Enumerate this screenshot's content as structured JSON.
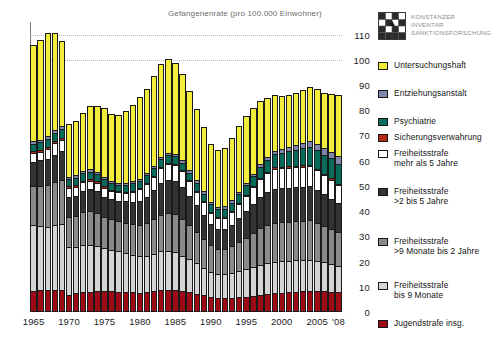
{
  "figure": {
    "title": "Gefangenenrate (pro 100.000 Einwohner)",
    "brand": {
      "logo_icon": "konstanz-grid-logo-icon",
      "line1": "KONSTANZER",
      "line2": "INVENTAR",
      "line3": "SANKTIONSFORSCHUNG"
    }
  },
  "legend": {
    "items": [
      {
        "label": "Untersuchungshaft",
        "color": "#f2ed3a",
        "top": 52
      },
      {
        "label": "Entziehungsanstalt",
        "color": "#8086ad",
        "top": 80
      },
      {
        "label": "Psychiatrie",
        "color": "#066b5a",
        "top": 108
      },
      {
        "label": "Sicherungsverwahrung",
        "color": "#b32b10",
        "top": 124
      },
      {
        "label": "Freiheitsstrafe\nmehr als 5 Jahre",
        "color": "#ffffff",
        "top": 140
      },
      {
        "label": "Freiheitsstrafe\n>2 bis 5 Jahre",
        "color": "#333333",
        "top": 178
      },
      {
        "label": "Freiheitsstrafe\n>9 Monate bis 2 Jahre",
        "color": "#8a8a8a",
        "top": 228
      },
      {
        "label": "Freiheitsstrafe\nbis 9 Monate",
        "color": "#d4d4d4",
        "top": 272
      },
      {
        "label": "Jugendstrafe insg.",
        "color": "#9e0b16",
        "top": 310
      }
    ]
  },
  "chart_data": {
    "type": "bar",
    "stacked": true,
    "title": "Gefangenenrate (pro 100.000 Einwohner)",
    "xlabel": "",
    "ylabel": "",
    "ylim": [
      0,
      115
    ],
    "yticks": [
      0,
      10,
      20,
      30,
      40,
      50,
      60,
      70,
      80,
      90,
      100,
      110
    ],
    "grid": "horizontal-dotted-at-100",
    "legend_position": "right",
    "xtick_labels": [
      "1965",
      "1970",
      "1975",
      "1980",
      "1985",
      "1990",
      "1995",
      "2000",
      "2005",
      "'08"
    ],
    "xtick_years": [
      1965,
      1970,
      1975,
      1980,
      1985,
      1990,
      1995,
      2000,
      2005,
      2008
    ],
    "categories": [
      1965,
      1966,
      1967,
      1968,
      1969,
      1970,
      1971,
      1972,
      1973,
      1974,
      1975,
      1976,
      1977,
      1978,
      1979,
      1980,
      1981,
      1982,
      1983,
      1984,
      1985,
      1986,
      1987,
      1988,
      1989,
      1990,
      1991,
      1992,
      1993,
      1994,
      1995,
      1996,
      1997,
      1998,
      1999,
      2000,
      2001,
      2002,
      2003,
      2004,
      2005,
      2006,
      2007,
      2008
    ],
    "series": [
      {
        "name": "Jugendstrafe insg.",
        "color": "#9e0b16",
        "values": [
          8.5,
          8.6,
          8.8,
          8.9,
          8.8,
          6.6,
          7.6,
          8.0,
          8.1,
          8.3,
          8.3,
          8.2,
          8.0,
          7.9,
          7.8,
          7.6,
          7.8,
          8.2,
          8.6,
          8.8,
          8.8,
          8.4,
          7.9,
          7.3,
          6.6,
          5.9,
          5.4,
          5.4,
          5.6,
          5.8,
          6.0,
          6.4,
          6.8,
          7.1,
          7.4,
          7.6,
          7.8,
          8.0,
          8.2,
          8.3,
          8.3,
          8.2,
          8.0,
          7.8
        ]
      },
      {
        "name": "Freiheitsstrafe bis 9 Monate",
        "color": "#d4d4d4",
        "values": [
          26.0,
          25.5,
          25.0,
          25.5,
          26.0,
          19.0,
          18.0,
          18.5,
          18.5,
          18.0,
          17.0,
          16.5,
          16.0,
          15.5,
          15.0,
          14.5,
          14.5,
          15.0,
          15.5,
          15.5,
          15.0,
          14.0,
          13.0,
          12.0,
          11.0,
          10.0,
          9.5,
          9.5,
          10.0,
          10.5,
          11.0,
          11.5,
          12.0,
          12.5,
          12.5,
          12.5,
          12.5,
          12.5,
          12.5,
          12.5,
          12.0,
          11.5,
          11.0,
          10.5
        ]
      },
      {
        "name": "Freiheitsstrafe >9 Monate bis 2 Jahre",
        "color": "#8a8a8a",
        "values": [
          15.5,
          16.0,
          16.5,
          17.0,
          17.5,
          12.0,
          12.5,
          13.0,
          13.5,
          13.0,
          12.5,
          12.0,
          12.0,
          12.0,
          12.0,
          12.5,
          13.0,
          13.5,
          14.5,
          15.0,
          15.0,
          14.5,
          13.5,
          12.5,
          11.5,
          10.5,
          10.0,
          10.0,
          10.5,
          11.5,
          12.5,
          13.5,
          14.5,
          15.0,
          15.5,
          15.5,
          15.5,
          15.5,
          15.5,
          15.5,
          15.0,
          14.5,
          14.0,
          13.5
        ]
      },
      {
        "name": "Freiheitsstrafe >2 bis 5 Jahre",
        "color": "#333333",
        "values": [
          9.5,
          10.0,
          10.5,
          11.0,
          11.5,
          8.0,
          8.0,
          8.5,
          8.5,
          8.5,
          8.0,
          8.0,
          8.0,
          8.5,
          9.0,
          9.5,
          10.5,
          11.5,
          12.5,
          13.0,
          13.0,
          12.5,
          11.5,
          10.5,
          9.5,
          8.5,
          8.0,
          8.0,
          8.5,
          9.5,
          10.5,
          11.5,
          12.5,
          13.0,
          13.5,
          13.5,
          13.5,
          13.5,
          13.5,
          13.5,
          13.0,
          12.5,
          12.0,
          11.5
        ]
      },
      {
        "name": "Freiheitsstrafe mehr als 5 Jahre",
        "color": "#ffffff",
        "values": [
          3.5,
          3.5,
          4.0,
          4.5,
          4.5,
          3.5,
          3.5,
          3.5,
          3.5,
          3.5,
          3.5,
          3.5,
          3.5,
          3.5,
          4.0,
          4.5,
          5.0,
          5.5,
          6.0,
          6.5,
          6.5,
          6.5,
          6.0,
          5.5,
          5.0,
          4.5,
          4.5,
          4.5,
          5.0,
          5.5,
          6.0,
          6.5,
          7.0,
          7.5,
          8.0,
          8.0,
          8.0,
          8.0,
          8.0,
          8.0,
          8.0,
          7.5,
          7.5,
          7.0
        ]
      },
      {
        "name": "Sicherungsverwahrung",
        "color": "#b32b10",
        "values": [
          0.8,
          0.8,
          0.8,
          0.8,
          0.8,
          0.7,
          0.7,
          0.6,
          0.6,
          0.5,
          0.5,
          0.4,
          0.4,
          0.4,
          0.4,
          0.4,
          0.4,
          0.4,
          0.4,
          0.4,
          0.4,
          0.4,
          0.4,
          0.4,
          0.4,
          0.4,
          0.4,
          0.4,
          0.4,
          0.4,
          0.4,
          0.4,
          0.4,
          0.4,
          0.5,
          0.5,
          0.5,
          0.5,
          0.6,
          0.6,
          0.6,
          0.6,
          0.6,
          0.6
        ]
      },
      {
        "name": "Psychiatrie",
        "color": "#066b5a",
        "values": [
          3.0,
          3.0,
          3.2,
          3.4,
          3.5,
          3.0,
          3.0,
          3.0,
          3.0,
          3.0,
          2.8,
          2.6,
          2.6,
          2.6,
          2.8,
          3.0,
          3.0,
          3.0,
          3.0,
          3.0,
          3.0,
          3.0,
          3.0,
          3.0,
          3.0,
          3.0,
          3.0,
          3.2,
          3.4,
          3.6,
          3.8,
          4.0,
          4.4,
          4.8,
          5.2,
          5.6,
          6.0,
          6.4,
          6.8,
          7.2,
          7.4,
          7.6,
          7.8,
          8.0
        ]
      },
      {
        "name": "Entziehungsanstalt",
        "color": "#8086ad",
        "values": [
          1.0,
          1.0,
          1.0,
          1.0,
          1.0,
          0.9,
          0.9,
          0.9,
          0.9,
          0.9,
          0.8,
          0.8,
          0.8,
          0.8,
          0.8,
          0.9,
          0.9,
          0.9,
          1.0,
          1.0,
          1.0,
          1.0,
          1.0,
          1.0,
          1.0,
          1.0,
          1.0,
          1.0,
          1.0,
          1.0,
          1.0,
          1.0,
          1.1,
          1.2,
          1.3,
          1.5,
          1.7,
          1.9,
          2.1,
          2.3,
          2.5,
          2.6,
          2.7,
          2.8
        ]
      },
      {
        "name": "Untersuchungshaft",
        "color": "#f2ed3a",
        "values": [
          38.0,
          39.5,
          41.0,
          38.5,
          34.0,
          21.0,
          21.5,
          23.0,
          25.0,
          26.0,
          27.5,
          26.5,
          27.0,
          28.5,
          30.5,
          32.5,
          33.5,
          35.5,
          37.0,
          37.0,
          36.0,
          34.0,
          31.5,
          28.5,
          25.5,
          23.0,
          22.5,
          23.0,
          24.5,
          26.0,
          26.5,
          26.0,
          25.0,
          23.5,
          22.0,
          21.0,
          20.5,
          20.5,
          21.0,
          21.5,
          21.5,
          22.0,
          23.0,
          24.5
        ]
      }
    ]
  }
}
